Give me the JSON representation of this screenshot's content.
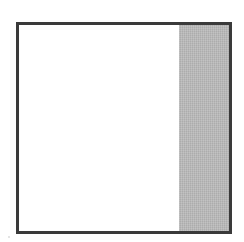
{
  "diagram": {
    "square": {
      "border_color": "#3a3a3a",
      "fill_color": "#ffffff"
    },
    "regions": [
      {
        "name": "unshaded",
        "width_fraction": 0.76,
        "color": "#ffffff"
      },
      {
        "name": "shaded",
        "width_fraction": 0.24,
        "color": "#b9b9b9"
      }
    ]
  }
}
